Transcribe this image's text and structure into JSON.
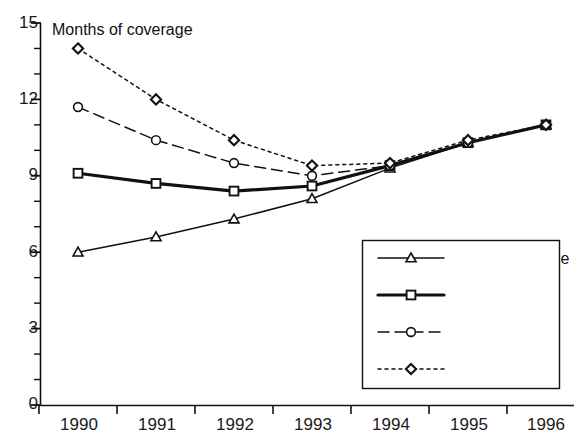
{
  "chart_data": {
    "type": "line",
    "title": "Months of coverage",
    "xlabel": "",
    "ylabel": "",
    "ylim": [
      0,
      15
    ],
    "yticks": [
      0,
      3,
      6,
      9,
      12,
      15
    ],
    "ytick_labels": [
      "0",
      "3",
      "6",
      "9",
      "12",
      "15"
    ],
    "minor_y_interval": 1,
    "grid": false,
    "legend_position": "bottom-right",
    "categories": [
      "1990",
      "1991",
      "1992",
      "1993",
      "1994",
      "1995",
      "1996"
    ],
    "series": [
      {
        "name": "No miles decline",
        "marker": "triangle",
        "linestyle": "solid",
        "linewidth": "thin",
        "color": "#111111",
        "values": [
          6.0,
          6.6,
          7.3,
          8.1,
          9.3,
          10.3,
          11.0
        ]
      },
      {
        "name": "2%/yr decline",
        "marker": "square",
        "linestyle": "solid",
        "linewidth": "thick",
        "color": "#111111",
        "values": [
          9.1,
          8.7,
          8.4,
          8.6,
          9.4,
          10.3,
          11.0
        ]
      },
      {
        "name": "4%/yr decline",
        "marker": "circle",
        "linestyle": "dashed",
        "linewidth": "thin",
        "color": "#111111",
        "values": [
          11.7,
          10.4,
          9.5,
          9.0,
          9.4,
          10.3,
          11.0
        ]
      },
      {
        "name": "6%/yr decline",
        "marker": "diamond",
        "linestyle": "dotted",
        "linewidth": "thin",
        "color": "#111111",
        "values": [
          14.0,
          12.0,
          10.4,
          9.4,
          9.5,
          10.4,
          11.0
        ]
      }
    ]
  },
  "axes": {
    "y_axis_name": "y-axis",
    "x_axis_name": "x-axis"
  },
  "legend": {
    "entries": [
      {
        "label": "No miles decline"
      },
      {
        "label": "2%/yr decline"
      },
      {
        "label": "4%/yr decline"
      },
      {
        "label": "6%/yr decline"
      }
    ]
  }
}
